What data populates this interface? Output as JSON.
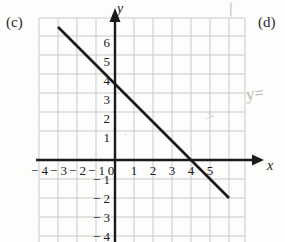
{
  "part_labels": {
    "left": "(c)",
    "right": "(d)"
  },
  "annotations": {
    "y_equals": "y=",
    "pencil_tick": "\\",
    "pencil_arrow": ">",
    "pencil_dot": "."
  },
  "axes": {
    "x_label": "x",
    "y_label": "y",
    "origin_label": "0",
    "x_ticks": [
      "− 4",
      "− 3",
      "− 2",
      "− 1",
      "1",
      "2",
      "3",
      "4",
      "5"
    ],
    "y_ticks": [
      "6",
      "5",
      "4",
      "3",
      "2",
      "1",
      "− 1",
      "− 2",
      "− 3",
      "− 4"
    ]
  },
  "colors": {
    "grid": "#c9c9c9",
    "axis": "#1a1a1a",
    "line": "#1a1a1a",
    "annotation": "#bdbab6",
    "text": "#1a1a1a"
  },
  "chart_data": {
    "type": "line",
    "title": "",
    "xlabel": "x",
    "ylabel": "y",
    "xlim": [
      -4.6,
      6.4
    ],
    "ylim": [
      -4.8,
      7.2
    ],
    "grid": true,
    "legend": null,
    "xticks": [
      -4,
      -3,
      -2,
      -1,
      0,
      1,
      2,
      3,
      4,
      5
    ],
    "yticks": [
      -4,
      -3,
      -2,
      -1,
      1,
      2,
      3,
      4,
      5,
      6
    ],
    "series": [
      {
        "name": "y = -x + 4",
        "slope": -1,
        "intercept": 4,
        "x": [
          -3,
          6
        ],
        "values": [
          7,
          -2
        ],
        "points": [
          {
            "x": -3,
            "y": 7
          },
          {
            "x": 0,
            "y": 4
          },
          {
            "x": 4,
            "y": 0
          },
          {
            "x": 6,
            "y": -2
          }
        ]
      }
    ],
    "x_intercept": 4,
    "y_intercept": 4
  }
}
